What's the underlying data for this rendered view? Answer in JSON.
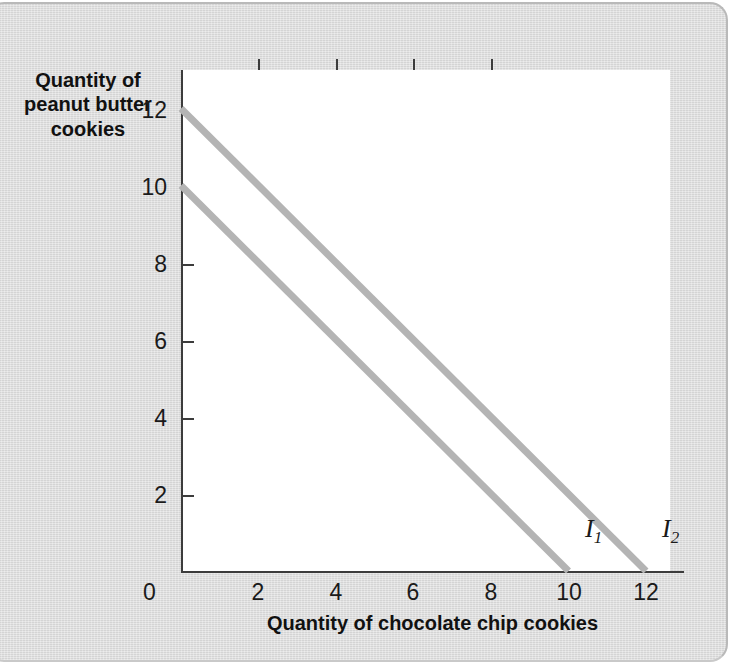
{
  "chart_data": {
    "type": "line",
    "title": "",
    "xlabel": "Quantity of chocolate chip cookies",
    "ylabel": "Quantity of peanut butter cookies",
    "xlim": [
      0,
      13
    ],
    "ylim": [
      0,
      13
    ],
    "grid": false,
    "legend_position": "inline-end-of-line",
    "x_ticks": [
      0,
      2,
      4,
      6,
      8,
      10,
      12
    ],
    "x_tick_labels": [
      "0",
      "2",
      "4",
      "6",
      "8",
      "10",
      "12"
    ],
    "y_ticks": [
      0,
      2,
      4,
      6,
      8,
      10,
      12
    ],
    "y_tick_labels": [
      "0",
      "2",
      "4",
      "6",
      "8",
      "10",
      "12"
    ],
    "series": [
      {
        "name": "I1",
        "label": "I",
        "subscript": "1",
        "color": "#b4b4b4",
        "x": [
          0,
          10
        ],
        "y": [
          10,
          0
        ],
        "x_intercept": 10,
        "y_intercept": 10,
        "slope": -1
      },
      {
        "name": "I2",
        "label": "I",
        "subscript": "2",
        "color": "#b4b4b4",
        "x": [
          0,
          12
        ],
        "y": [
          12,
          0
        ],
        "x_intercept": 12,
        "y_intercept": 12,
        "slope": -1
      }
    ]
  },
  "figure": {
    "y_axis_title_lines": [
      "Quantity of",
      "peanut butter",
      "cookies"
    ],
    "x_axis_title": "Quantity of chocolate chip cookies",
    "origin_label": "0",
    "y_labels": [
      "12",
      "10",
      "8",
      "6",
      "4",
      "2"
    ],
    "x_labels": [
      "2",
      "4",
      "6",
      "8",
      "10",
      "12"
    ],
    "curve_labels": [
      {
        "letter": "I",
        "sub": "1"
      },
      {
        "letter": "I",
        "sub": "2"
      }
    ]
  },
  "colors": {
    "panel_background": "#dcdcdc",
    "plot_background": "#ffffff",
    "axis": "#3c3c3c",
    "line": "#b4b4b4",
    "text": "#111111"
  }
}
